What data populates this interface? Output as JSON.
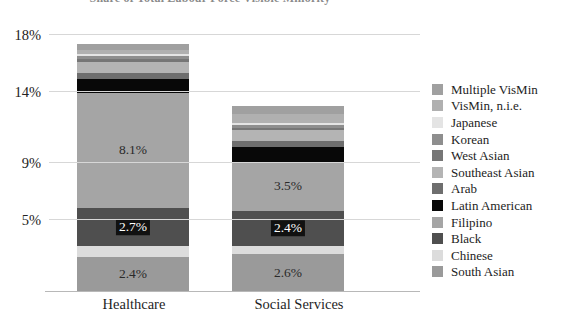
{
  "chart_data": {
    "type": "bar",
    "subtype": "stacked-bar",
    "title": "Share of Total Labour Force Visible Minority",
    "xlabel": "",
    "ylabel": "",
    "categories": [
      "Healthcare",
      "Social Services"
    ],
    "ylim": [
      0,
      18
    ],
    "yticks": [
      5,
      9,
      14,
      18
    ],
    "ytick_labels": [
      "5%",
      "9%",
      "14%",
      "18%"
    ],
    "grid": true,
    "legend_position": "right",
    "series": [
      {
        "name": "South Asian",
        "color": "#9a9a9a",
        "values": [
          2.4,
          2.6
        ],
        "labels": [
          "2.4%",
          "2.6%"
        ]
      },
      {
        "name": "Chinese",
        "color": "#dcdcdc",
        "values": [
          0.75,
          0.6
        ],
        "labels": [
          "",
          ""
        ]
      },
      {
        "name": "Black",
        "color": "#4f4f4f",
        "values": [
          2.7,
          2.4
        ],
        "labels": [
          "2.7%",
          "2.4%"
        ]
      },
      {
        "name": "Filipino",
        "color": "#a5a5a5",
        "values": [
          8.1,
          3.5
        ],
        "labels": [
          "8.1%",
          "3.5%"
        ]
      },
      {
        "name": "Latin American",
        "color": "#080808",
        "values": [
          0.95,
          1.05
        ],
        "labels": [
          "",
          ""
        ]
      },
      {
        "name": "Arab",
        "color": "#6e6e6e",
        "values": [
          0.45,
          0.4
        ],
        "labels": [
          "",
          ""
        ]
      },
      {
        "name": "Southeast Asian",
        "color": "#b4b4b4",
        "values": [
          0.75,
          0.75
        ],
        "labels": [
          "",
          ""
        ]
      },
      {
        "name": "West Asian",
        "color": "#767676",
        "values": [
          0.2,
          0.2
        ],
        "labels": [
          "",
          ""
        ]
      },
      {
        "name": "Korean",
        "color": "#8e8e8e",
        "values": [
          0.2,
          0.18
        ],
        "labels": [
          "",
          ""
        ]
      },
      {
        "name": "Japanese",
        "color": "#e4e4e4",
        "values": [
          0.18,
          0.15
        ],
        "labels": [
          "",
          ""
        ]
      },
      {
        "name": "VisMin, n.i.e.",
        "color": "#b0b0b0",
        "values": [
          0.25,
          0.6
        ],
        "labels": [
          "",
          ""
        ]
      },
      {
        "name": "Multiple VisMin",
        "color": "#a0a0a0",
        "values": [
          0.47,
          0.57
        ],
        "labels": [
          "",
          ""
        ]
      }
    ],
    "totals": [
      17.4,
      13.0
    ]
  },
  "legend": {
    "items": [
      {
        "label": "Multiple VisMin",
        "color": "#a0a0a0"
      },
      {
        "label": "VisMin, n.i.e.",
        "color": "#b0b0b0"
      },
      {
        "label": "Japanese",
        "color": "#e4e4e4"
      },
      {
        "label": "Korean",
        "color": "#8e8e8e"
      },
      {
        "label": "West Asian",
        "color": "#767676"
      },
      {
        "label": "Southeast Asian",
        "color": "#b4b4b4"
      },
      {
        "label": "Arab",
        "color": "#6e6e6e"
      },
      {
        "label": "Latin American",
        "color": "#080808"
      },
      {
        "label": "Filipino",
        "color": "#a5a5a5"
      },
      {
        "label": "Black",
        "color": "#4f4f4f"
      },
      {
        "label": "Chinese",
        "color": "#dcdcdc"
      },
      {
        "label": "South Asian",
        "color": "#9a9a9a"
      }
    ]
  }
}
